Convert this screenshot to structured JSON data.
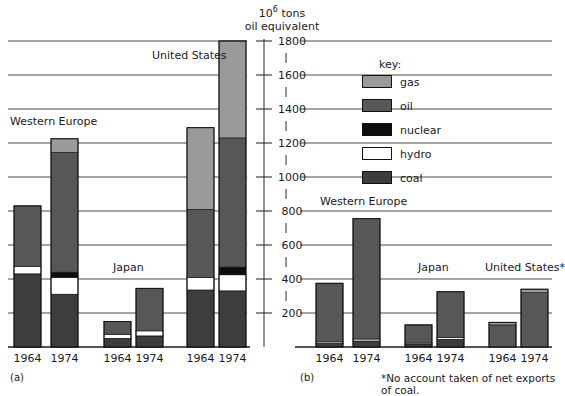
{
  "axis": {
    "unit_line1": "10⁶ tons",
    "unit_line2": "oil equivalent",
    "ticks": [
      200,
      400,
      600,
      800,
      1000,
      1200,
      1400,
      1600,
      1800
    ],
    "max": 1800,
    "min": 0
  },
  "key": {
    "title": "key:",
    "entries": [
      {
        "label": "gas",
        "color": "#9a9a9a"
      },
      {
        "label": "oil",
        "color": "#575757"
      },
      {
        "label": "nuclear",
        "color": "#0d0d0d"
      },
      {
        "label": "hydro",
        "color": "#ffffff"
      },
      {
        "label": "coal",
        "color": "#3d3d3d"
      }
    ]
  },
  "panels": [
    {
      "letter": "(a)",
      "regions": [
        "Western Europe",
        "Japan",
        "United States"
      ]
    },
    {
      "letter": "(b)",
      "regions": [
        "Western Europe",
        "Japan",
        "United States*"
      ]
    }
  ],
  "footnote": "*No account taken of net exports of coal.",
  "years": [
    "1964",
    "1974",
    "1964",
    "1974",
    "1964",
    "1974"
  ],
  "chart_data": {
    "type": "bar",
    "subtitle": "",
    "ylabel": "10⁶ tons oil equivalent",
    "xlabel": "",
    "ylim": [
      0,
      1800
    ],
    "yticks": [
      200,
      400,
      600,
      800,
      1000,
      1200,
      1400,
      1600,
      1800
    ],
    "grid": true,
    "stacked": true,
    "legend_position": "top-center-right",
    "legend_entries": [
      "gas",
      "oil",
      "nuclear",
      "hydro",
      "coal"
    ],
    "series_colors": {
      "gas": "#9a9a9a",
      "oil": "#575757",
      "nuclear": "#0d0d0d",
      "hydro": "#ffffff",
      "coal": "#3d3d3d"
    },
    "panels": [
      {
        "name": "(a)",
        "description": "Total primary energy consumption",
        "groups": [
          {
            "region": "Western Europe",
            "bars": [
              {
                "year": "1964",
                "total": 830,
                "segments": {
                  "coal": 430,
                  "hydro": 45,
                  "nuclear": 0,
                  "oil": 355,
                  "gas": 0
                }
              },
              {
                "year": "1974",
                "total": 1225,
                "segments": {
                  "coal": 310,
                  "hydro": 100,
                  "nuclear": 30,
                  "oil": 705,
                  "gas": 80
                }
              }
            ]
          },
          {
            "region": "Japan",
            "bars": [
              {
                "year": "1964",
                "total": 150,
                "segments": {
                  "coal": 50,
                  "hydro": 25,
                  "nuclear": 0,
                  "oil": 75,
                  "gas": 0
                }
              },
              {
                "year": "1974",
                "total": 345,
                "segments": {
                  "coal": 65,
                  "hydro": 30,
                  "nuclear": 0,
                  "oil": 250,
                  "gas": 0
                }
              }
            ]
          },
          {
            "region": "United States",
            "bars": [
              {
                "year": "1964",
                "total": 1290,
                "segments": {
                  "coal": 335,
                  "hydro": 75,
                  "nuclear": 0,
                  "oil": 400,
                  "gas": 480
                }
              },
              {
                "year": "1974",
                "total": 1800,
                "segments": {
                  "coal": 330,
                  "hydro": 95,
                  "nuclear": 45,
                  "oil": 760,
                  "gas": 570
                }
              }
            ]
          }
        ]
      },
      {
        "name": "(b)",
        "description": "Net imports of energy",
        "groups": [
          {
            "region": "Western Europe",
            "bars": [
              {
                "year": "1964",
                "total": 375,
                "segments": {
                  "coal": 20,
                  "hydro": 10,
                  "nuclear": 0,
                  "oil": 345,
                  "gas": 0
                }
              },
              {
                "year": "1974",
                "total": 755,
                "segments": {
                  "coal": 35,
                  "hydro": 12,
                  "nuclear": 0,
                  "oil": 708,
                  "gas": 0
                }
              }
            ]
          },
          {
            "region": "Japan",
            "bars": [
              {
                "year": "1964",
                "total": 130,
                "segments": {
                  "coal": 15,
                  "hydro": 8,
                  "nuclear": 0,
                  "oil": 107,
                  "gas": 0
                }
              },
              {
                "year": "1974",
                "total": 325,
                "segments": {
                  "coal": 45,
                  "hydro": 12,
                  "nuclear": 0,
                  "oil": 268,
                  "gas": 0
                }
              }
            ]
          },
          {
            "region": "United States*",
            "bars": [
              {
                "year": "1964",
                "total": 145,
                "segments": {
                  "coal": 0,
                  "hydro": 0,
                  "nuclear": 0,
                  "oil": 130,
                  "gas": 15
                }
              },
              {
                "year": "1974",
                "total": 340,
                "segments": {
                  "coal": 0,
                  "hydro": 0,
                  "nuclear": 0,
                  "oil": 320,
                  "gas": 20
                }
              }
            ]
          }
        ]
      }
    ]
  }
}
